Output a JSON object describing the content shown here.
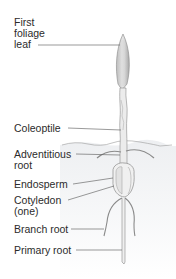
{
  "diagram": {
    "labels": [
      {
        "id": "first-foliage-leaf",
        "lines": [
          "First",
          "foliage",
          "leaf"
        ]
      },
      {
        "id": "coleoptile",
        "lines": [
          "Coleoptile"
        ]
      },
      {
        "id": "adventitious-root",
        "lines": [
          "Adventitious",
          "root"
        ]
      },
      {
        "id": "endosperm",
        "lines": [
          "Endosperm"
        ]
      },
      {
        "id": "cotyledon",
        "lines": [
          "Cotyledon",
          "(one)"
        ]
      },
      {
        "id": "branch-root",
        "lines": [
          "Branch root"
        ]
      },
      {
        "id": "primary-root",
        "lines": [
          "Primary root"
        ]
      }
    ],
    "colors": {
      "text": "#2b2b2b",
      "leader": "#555555",
      "plant_outline": "#8a8a8a",
      "plant_fill": "#e4e4e4",
      "soil": "#eceef0"
    }
  }
}
